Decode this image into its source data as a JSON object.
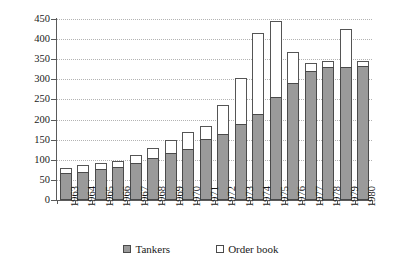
{
  "chart_data": {
    "type": "bar",
    "stacked": true,
    "title": "",
    "subtitle": "",
    "xlabel": "",
    "ylabel": "",
    "ylim": [
      0,
      450
    ],
    "ytick_step": 50,
    "yticks": [
      0,
      50,
      100,
      150,
      200,
      250,
      300,
      350,
      400,
      450
    ],
    "grid": true,
    "grid_style": "dotted horizontal",
    "legend_position": "bottom-center",
    "categories": [
      "1963",
      "1964",
      "1965",
      "1966",
      "1967",
      "1968",
      "1969",
      "1970",
      "1971",
      "1972",
      "1973",
      "1974",
      "1975",
      "1976",
      "1977",
      "1978",
      "1979",
      "1980"
    ],
    "series": [
      {
        "name": "Tankers",
        "color": "#9a9a9a",
        "values": [
          67,
          70,
          78,
          83,
          92,
          105,
          117,
          127,
          152,
          163,
          190,
          215,
          255,
          290,
          320,
          330,
          330,
          333
        ]
      },
      {
        "name": "Order book",
        "color": "#ffffff",
        "values": [
          13,
          18,
          14,
          14,
          21,
          25,
          33,
          42,
          32,
          72,
          113,
          200,
          190,
          77,
          21,
          15,
          95,
          12
        ]
      }
    ],
    "totals": [
      80,
      88,
      92,
      97,
      113,
      130,
      150,
      169,
      184,
      235,
      303,
      415,
      445,
      367,
      341,
      345,
      425,
      345
    ]
  },
  "legend": {
    "entries": [
      {
        "label": "Tankers",
        "swatch": "gray-filled-square"
      },
      {
        "label": "Order book",
        "swatch": "white-outlined-square"
      }
    ]
  }
}
